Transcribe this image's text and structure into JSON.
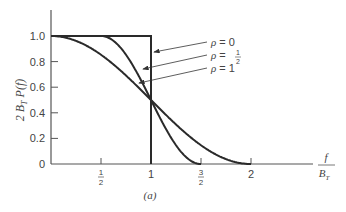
{
  "chart_data": {
    "type": "line",
    "title": "",
    "subtitle": "(a)",
    "xlabel": "f / B_T",
    "ylabel": "2 B_T P(f)",
    "xlim": [
      0,
      2.6
    ],
    "ylim": [
      0,
      1.15
    ],
    "grid": false,
    "x_ticks": [
      {
        "value": 0.5,
        "label_num": "1",
        "label_den": "2"
      },
      {
        "value": 1,
        "label": "1"
      },
      {
        "value": 1.5,
        "label_num": "3",
        "label_den": "2"
      },
      {
        "value": 2,
        "label": "2"
      }
    ],
    "y_ticks": [
      {
        "value": 0,
        "label": "0"
      },
      {
        "value": 0.2,
        "label": "0.2"
      },
      {
        "value": 0.4,
        "label": "0.4"
      },
      {
        "value": 0.6,
        "label": "0.6"
      },
      {
        "value": 0.8,
        "label": "0.8"
      },
      {
        "value": 1.0,
        "label": "1.0"
      }
    ],
    "series": [
      {
        "name": "ρ = 0",
        "rolloff": 0,
        "x": [
          0,
          1,
          1
        ],
        "values": [
          1.0,
          1.0,
          0
        ]
      },
      {
        "name": "ρ = 1/2",
        "rolloff": 0.5,
        "x": [
          0,
          0.5,
          0.75,
          1.0,
          1.25,
          1.5
        ],
        "values": [
          1.0,
          1.0,
          0.854,
          0.5,
          0.146,
          0
        ]
      },
      {
        "name": "ρ = 1",
        "rolloff": 1,
        "x": [
          0,
          0.5,
          1.0,
          1.5,
          2.0
        ],
        "values": [
          1.0,
          0.854,
          0.5,
          0.146,
          0
        ]
      }
    ],
    "annotations": [
      {
        "text_sym": "ρ",
        "text_eq": "= 0",
        "target": "ρ = 0 curve"
      },
      {
        "text_sym": "ρ",
        "text_eq": "=",
        "frac_num": "1",
        "frac_den": "2",
        "target": "ρ = 1/2 curve"
      },
      {
        "text_sym": "ρ",
        "text_eq": "= 1",
        "target": "ρ = 1 curve"
      }
    ]
  },
  "labels": {
    "ylabel_main": "2 B",
    "ylabel_sub": "T",
    "ylabel_tail": " P(f)",
    "xlabel_num": "f",
    "xlabel_den": "B",
    "xlabel_den_sub": "T",
    "caption": "(a)"
  }
}
